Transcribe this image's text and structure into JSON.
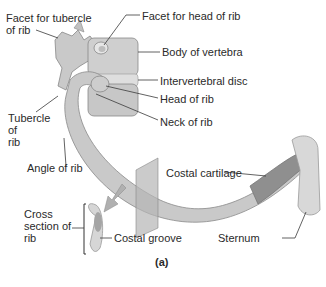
{
  "figure": {
    "caption": "(a)",
    "colors": {
      "bone": "#c9c9c9",
      "bone_shadow": "#9a9a9a",
      "cartilage": "#8f8f8f",
      "plane": "#b5b5b5",
      "text": "#2a2a2a",
      "leader": "#3a3a3a"
    }
  },
  "labels": {
    "facet_tubercle": "Facet for tubercle\nof rib",
    "facet_head": "Facet for head of rib",
    "body_vertebra": "Body of vertebra",
    "intervertebral_disc": "Intervertebral disc",
    "head_rib": "Head of rib",
    "neck_rib": "Neck of rib",
    "tubercle_rib": "Tubercle\nof\nrib",
    "angle_rib": "Angle of rib",
    "costal_cartilage": "Costal cartilage",
    "cross_section": "Cross\nsection of\nrib",
    "costal_groove": "Costal groove",
    "sternum": "Sternum"
  }
}
